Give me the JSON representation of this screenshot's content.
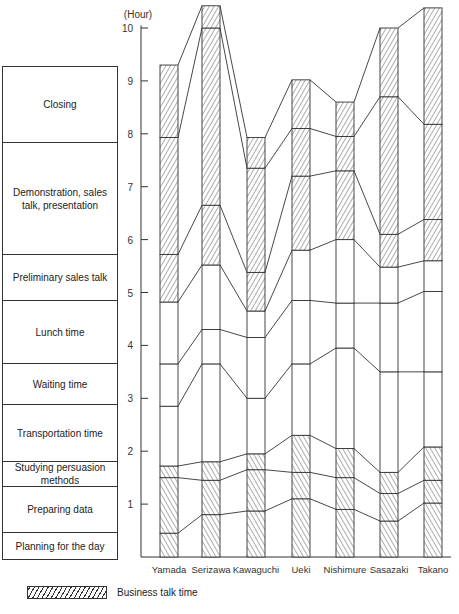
{
  "chart_data": {
    "type": "bar",
    "subtype": "stacked-bar-with-connecting-lines",
    "title": "",
    "ylabel": "(Hour)",
    "xlabel": "",
    "ylim": [
      0,
      10.5
    ],
    "yticks": [
      1,
      2,
      3,
      4,
      5,
      6,
      7,
      8,
      9,
      10
    ],
    "grid": false,
    "legend_position": "bottom-left",
    "categories": [
      "Yamada",
      "Serizawa",
      "Kawaguchi",
      "Ueki",
      "Nishimure",
      "Sasazaki",
      "Takano"
    ],
    "segments_bottom_to_top": [
      "Planning for the day",
      "Preparing data",
      "Studying persuasion methods",
      "Transportation time",
      "Waiting time",
      "Lunch time",
      "Preliminary sales talk",
      "Demonstration, sales talk, presentation",
      "Closing"
    ],
    "business_talk_segments": [
      "Planning for the day",
      "Preparing data",
      "Studying persuasion methods",
      "Preliminary sales talk",
      "Demonstration, sales talk, presentation",
      "Closing"
    ],
    "cumulative_hours": {
      "Yamada": [
        0.45,
        1.5,
        1.72,
        2.85,
        3.65,
        4.82,
        5.72,
        7.93,
        9.3
      ],
      "Serizawa": [
        0.8,
        1.45,
        1.8,
        3.65,
        4.3,
        5.52,
        6.65,
        10.0,
        10.42
      ],
      "Kawaguchi": [
        0.87,
        1.65,
        1.95,
        3.0,
        4.15,
        4.65,
        5.38,
        7.35,
        7.93
      ],
      "Ueki": [
        1.1,
        1.6,
        2.3,
        3.65,
        4.85,
        5.8,
        7.2,
        8.1,
        9.02
      ],
      "Nishimure": [
        0.9,
        1.5,
        2.05,
        3.95,
        4.8,
        6.0,
        7.3,
        7.95,
        8.6
      ],
      "Sasazaki": [
        0.68,
        1.2,
        1.6,
        3.5,
        4.8,
        5.48,
        6.1,
        8.7,
        10.0
      ],
      "Takano": [
        1.02,
        1.45,
        2.08,
        3.5,
        5.02,
        5.6,
        6.38,
        8.18,
        10.38
      ]
    },
    "series": [
      {
        "name": "Planning for the day",
        "values": [
          0.45,
          0.8,
          0.87,
          1.1,
          0.9,
          0.68,
          1.02
        ]
      },
      {
        "name": "Preparing data",
        "values": [
          1.05,
          0.65,
          0.78,
          0.5,
          0.6,
          0.52,
          0.43
        ]
      },
      {
        "name": "Studying persuasion methods",
        "values": [
          0.22,
          0.35,
          0.3,
          0.7,
          0.55,
          0.4,
          0.63
        ]
      },
      {
        "name": "Transportation time",
        "values": [
          1.13,
          1.85,
          1.05,
          1.35,
          1.9,
          1.9,
          1.42
        ]
      },
      {
        "name": "Waiting time",
        "values": [
          0.8,
          0.65,
          1.15,
          1.2,
          0.85,
          1.3,
          1.52
        ]
      },
      {
        "name": "Lunch time",
        "values": [
          1.17,
          1.22,
          0.5,
          0.95,
          1.2,
          0.68,
          0.58
        ]
      },
      {
        "name": "Preliminary sales talk",
        "values": [
          0.9,
          1.13,
          0.73,
          1.4,
          1.3,
          0.62,
          0.78
        ]
      },
      {
        "name": "Demonstration, sales talk, presentation",
        "values": [
          2.21,
          3.35,
          1.97,
          0.9,
          0.65,
          2.6,
          1.8
        ]
      },
      {
        "name": "Closing",
        "values": [
          1.37,
          0.42,
          0.58,
          0.92,
          0.65,
          1.3,
          2.2
        ]
      }
    ],
    "legend": [
      {
        "label": "Business talk time",
        "pattern": "diagonal-hatch"
      }
    ]
  },
  "axis": {
    "unit_label": "(Hour)",
    "tick_labels": [
      "1",
      "2",
      "3",
      "4",
      "5",
      "6",
      "7",
      "8",
      "9",
      "10"
    ]
  },
  "side_legend": {
    "boxes": [
      {
        "label": "Closing",
        "height": 76
      },
      {
        "label": "Demonstration, sales talk, presentation",
        "height": 112
      },
      {
        "label": "Preliminary sales talk",
        "height": 46
      },
      {
        "label": "Lunch time",
        "height": 63
      },
      {
        "label": "Waiting time",
        "height": 41
      },
      {
        "label": "Transportation time",
        "height": 57
      },
      {
        "label": "Studying persuasion methods",
        "height": 25
      },
      {
        "label": "Preparing data",
        "height": 46
      },
      {
        "label": "Planning for the day",
        "height": 26
      }
    ]
  },
  "key": {
    "label": "Business talk time"
  },
  "colors": {
    "ink": "#333333",
    "background": "#ffffff"
  }
}
